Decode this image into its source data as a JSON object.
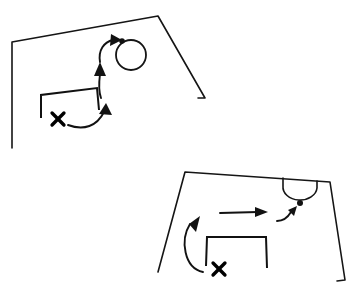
{
  "page": {
    "background_color": "#ffffff",
    "ink_color": "#121212",
    "width": 357,
    "height": 292
  },
  "diagrams": [
    {
      "id": "top-diagram",
      "name": "Upper drill diagram",
      "description": "Hand drawn penalty area corner with goal, player X, dribble arrow and circle marker",
      "pitch_boundary": {
        "name": "pitch-boundary-top",
        "points": "12,148 12,42 158,16 205,98 198,98"
      },
      "goal": {
        "name": "goal-top",
        "points": "41,118 41,95 97,88 99,110"
      },
      "circle_marker": {
        "name": "circle-marker-top",
        "cx": 131,
        "cy": 55,
        "r": 15
      },
      "ball": {
        "name": "ball-top",
        "cx": 122,
        "cy": 41,
        "r": 2.8
      },
      "player_x": {
        "name": "player-x-top",
        "cx": 58,
        "cy": 119,
        "size": 7
      },
      "arrows": [
        {
          "name": "run-arrow-top-lower",
          "type": "curve",
          "path": "M 68,125 C 84,131 97,126 104,112",
          "head": "106,103 112,115 99,114"
        },
        {
          "name": "run-arrow-top-middle",
          "type": "curve",
          "path": "M 101,98 C 98,90 99,82 100,74",
          "head": "100,62 106,76 94,76"
        },
        {
          "name": "run-arrow-top-upper",
          "type": "curve",
          "path": "M 100,62 C 98,50 104,42 113,40",
          "head": "122,40 110,46 111,34"
        }
      ]
    },
    {
      "id": "bottom-diagram",
      "name": "Lower drill diagram",
      "description": "Hand drawn penalty area with goal, penalty arc, player X, curved run arrow, straight pass arrow and ball",
      "pitch_boundary": {
        "name": "pitch-boundary-bottom",
        "points": "158,272 185,172 330,182 345,280 337,281"
      },
      "penalty_arc": {
        "name": "penalty-arc-bottom",
        "path": "M 283,178 L 283,186 A 17 13 0 0 0 317,188 L 317,181"
      },
      "goal": {
        "name": "goal-bottom",
        "points": "206,266 207,237 266,237 267,268"
      },
      "ball": {
        "name": "ball-bottom",
        "cx": 300,
        "cy": 203,
        "r": 3.0
      },
      "player_x": {
        "name": "player-x-bottom",
        "cx": 219,
        "cy": 269,
        "size": 7
      },
      "arrows": [
        {
          "name": "run-arrow-bottom-curve",
          "type": "curve",
          "path": "M 203,272 C 184,268 180,240 190,224",
          "head": "200,216 189,224 196,232"
        },
        {
          "name": "pass-arrow-bottom-straight",
          "type": "line",
          "path": "M 220,213 L 258,212",
          "head": "268,212 255,217 255,207"
        },
        {
          "name": "shot-arrow-bottom-short",
          "type": "curve",
          "path": "M 277,221 C 284,221 288,217 291,212",
          "head": "297,206 288,210 294,216"
        }
      ]
    }
  ]
}
